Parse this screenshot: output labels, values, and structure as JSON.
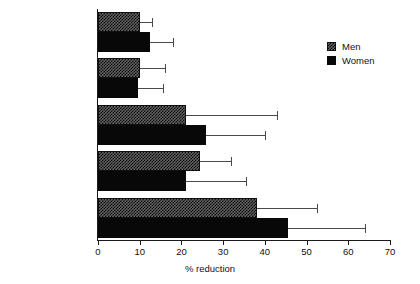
{
  "chart_data": {
    "type": "bar",
    "orientation": "horizontal",
    "title": "",
    "subtitle": "",
    "xlabel": "% reduction",
    "ylabel": "",
    "xlim": [
      0,
      70
    ],
    "xticks": [
      0,
      10,
      20,
      30,
      40,
      50,
      60,
      70
    ],
    "xtick_labels": [
      "0",
      "10",
      "20",
      "30",
      "40",
      "50",
      "60",
      "70"
    ],
    "grid": false,
    "legend_position": "top-right",
    "categories": [
      "BMI",
      "Waist",
      "Central fat mass",
      "Subcutaneous AT",
      "Intra-abdominal AT"
    ],
    "series": [
      {
        "name": "Men",
        "color": "#606060",
        "pattern": "checker-hatch",
        "values": [
          10.0,
          10.0,
          21.0,
          24.5,
          38.0
        ],
        "errors_upper": [
          13.0,
          16.0,
          43.0,
          32.0,
          52.5
        ]
      },
      {
        "name": "Women",
        "color": "#080808",
        "pattern": "solid",
        "values": [
          12.5,
          9.5,
          26.0,
          21.0,
          45.5
        ],
        "errors_upper": [
          18.0,
          15.5,
          40.0,
          35.5,
          64.0
        ]
      }
    ],
    "legend": [
      {
        "label": "Men"
      },
      {
        "label": "Women"
      }
    ]
  }
}
